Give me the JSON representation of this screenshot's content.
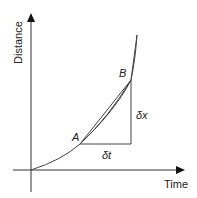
{
  "diagram": {
    "axes": {
      "x_label": "Time",
      "y_label": "Distance"
    },
    "points": {
      "a_label": "A",
      "b_label": "B"
    },
    "annotations": {
      "delta_t": "δt",
      "delta_x": "δx"
    },
    "colors": {
      "line": "#333333",
      "background": "#ffffff"
    }
  }
}
